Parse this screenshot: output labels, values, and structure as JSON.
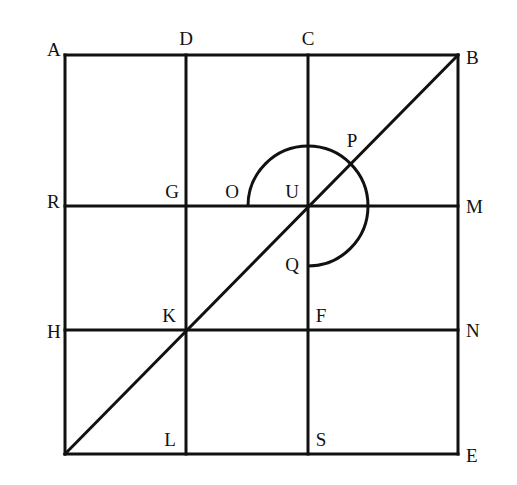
{
  "diagram": {
    "type": "geometry-grid",
    "stroke_color": "#111111",
    "background": "#ffffff",
    "square": {
      "corners": [
        "A",
        "B",
        "E"
      ],
      "bottom_left_unlabeled": true
    },
    "points": {
      "A": {
        "label": "A",
        "x": 47,
        "y": 56
      },
      "D": {
        "label": "D",
        "x": 186,
        "y": 45
      },
      "C": {
        "label": "C",
        "x": 308,
        "y": 45
      },
      "B": {
        "label": "B",
        "x": 466,
        "y": 64
      },
      "R": {
        "label": "R",
        "x": 47,
        "y": 208
      },
      "G": {
        "label": "G",
        "x": 172,
        "y": 198
      },
      "O": {
        "label": "O",
        "x": 232,
        "y": 198
      },
      "U": {
        "label": "U",
        "x": 292,
        "y": 198
      },
      "P": {
        "label": "P",
        "x": 352,
        "y": 147
      },
      "M": {
        "label": "M",
        "x": 466,
        "y": 213
      },
      "Q": {
        "label": "Q",
        "x": 292,
        "y": 271
      },
      "H": {
        "label": "H",
        "x": 47,
        "y": 338
      },
      "K": {
        "label": "K",
        "x": 169,
        "y": 322
      },
      "F": {
        "label": "F",
        "x": 321,
        "y": 322
      },
      "N": {
        "label": "N",
        "x": 466,
        "y": 337
      },
      "L": {
        "label": "L",
        "x": 170,
        "y": 446
      },
      "S": {
        "label": "S",
        "x": 321,
        "y": 446
      },
      "E": {
        "label": "E",
        "x": 466,
        "y": 462
      }
    },
    "segments": [
      {
        "name": "top-edge-AB",
        "x1": 65,
        "y1": 55,
        "x2": 458,
        "y2": 55
      },
      {
        "name": "bottom-edge",
        "x1": 65,
        "y1": 454,
        "x2": 458,
        "y2": 454
      },
      {
        "name": "left-edge",
        "x1": 65,
        "y1": 55,
        "x2": 65,
        "y2": 454
      },
      {
        "name": "right-edge-BE",
        "x1": 458,
        "y1": 55,
        "x2": 458,
        "y2": 454
      },
      {
        "name": "vertical-DL",
        "x1": 186,
        "y1": 55,
        "x2": 186,
        "y2": 454
      },
      {
        "name": "vertical-CS",
        "x1": 308,
        "y1": 55,
        "x2": 308,
        "y2": 454
      },
      {
        "name": "horizontal-RM",
        "x1": 65,
        "y1": 206,
        "x2": 458,
        "y2": 206
      },
      {
        "name": "horizontal-HN",
        "x1": 65,
        "y1": 330,
        "x2": 458,
        "y2": 330
      },
      {
        "name": "diagonal-to-B",
        "x1": 65,
        "y1": 454,
        "x2": 458,
        "y2": 55
      }
    ],
    "arc": {
      "name": "arc-OPQ",
      "center": "U",
      "cx": 308,
      "cy": 206,
      "r": 60,
      "from": "O",
      "to": "Q",
      "sweep_degrees": 270
    }
  }
}
